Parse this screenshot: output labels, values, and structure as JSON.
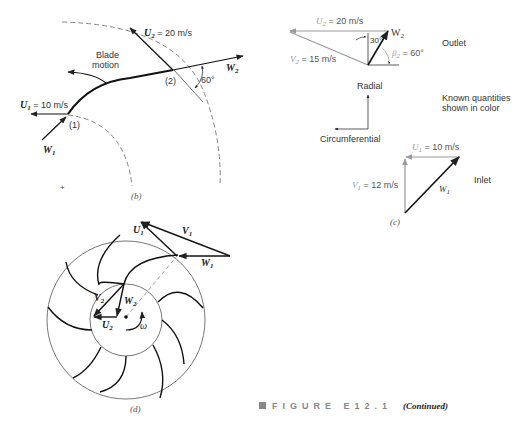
{
  "figure": {
    "caption_label": "FIGURE E12.1",
    "caption_note": "(Continued)",
    "caption_marker_color": "#888888"
  },
  "panel_b": {
    "label": "(b)",
    "u2": "U",
    "u2_sub": "2",
    "u2_value": " = 20 m/s",
    "u1": "U",
    "u1_sub": "1",
    "u1_value": " = 10 m/s",
    "w1": "W",
    "w1_sub": "1",
    "w2": "W",
    "w2_sub": "2",
    "blade_motion_line1": "Blade",
    "blade_motion_line2": "motion",
    "point1": "(1)",
    "point2": "(2)",
    "angle": "60°",
    "center_mark": "+"
  },
  "panel_c": {
    "label": "(c)",
    "outlet": {
      "u2": "U",
      "u2_sub": "2",
      "u2_value": " = 20 m/s",
      "v2": "V",
      "v2_sub": "2",
      "v2_value": " = 15 m/s",
      "w2": "W",
      "w2_sub": "2",
      "angle_30": "30°",
      "beta2": "β",
      "beta2_sub": "2",
      "beta2_value": " = 60°",
      "title": "Outlet"
    },
    "axes": {
      "radial": "Radial",
      "circumferential": "Circumferential"
    },
    "note_line1": "Known quantities",
    "note_line2": "shown in color",
    "inlet": {
      "u1": "U",
      "u1_sub": "1",
      "u1_value": " = 10 m/s",
      "v1": "V",
      "v1_sub": "1",
      "v1_value": " = 12 m/s",
      "w1": "W",
      "w1_sub": "1",
      "title": "Inlet"
    },
    "known_color": "#999999"
  },
  "panel_d": {
    "label": "(d)",
    "u1": "U",
    "u1_sub": "1",
    "v1": "V",
    "v1_sub": "1",
    "w1": "W",
    "w1_sub": "1",
    "v2": "V",
    "v2_sub": "2",
    "w2": "W",
    "w2_sub": "2",
    "u2": "U",
    "u2_sub": "2",
    "omega": "ω"
  }
}
